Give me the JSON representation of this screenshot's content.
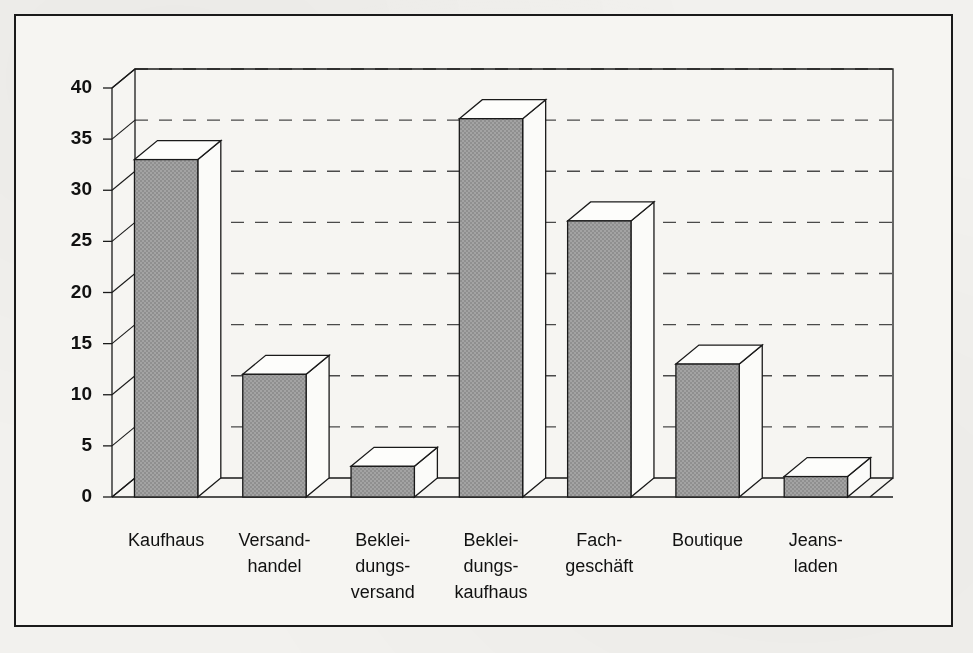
{
  "chart_data": {
    "type": "bar",
    "title": "",
    "subtitle": "",
    "xlabel": "",
    "ylabel": "",
    "ylim": [
      0,
      40
    ],
    "yticks": [
      0,
      5,
      10,
      15,
      20,
      25,
      30,
      35,
      40
    ],
    "grid": true,
    "grid_style": "dashed-horizontal",
    "legend": "none",
    "style": "3d-isometric-bars",
    "categories": [
      "Kaufhaus",
      "Versand-\nhandel",
      "Beklei-\ndungs-\nversand",
      "Beklei-\ndungs-\nkaufhaus",
      "Fach-\ngeschäft",
      "Boutique",
      "Jeans-\nladen"
    ],
    "category_lines": [
      [
        "Kaufhaus"
      ],
      [
        "Versand-",
        "handel"
      ],
      [
        "Beklei-",
        "dungs-",
        "versand"
      ],
      [
        "Beklei-",
        "dungs-",
        "kaufhaus"
      ],
      [
        "Fach-",
        "geschäft"
      ],
      [
        "Boutique"
      ],
      [
        "Jeans-",
        "laden"
      ]
    ],
    "values": [
      33,
      12,
      3,
      37,
      27,
      13,
      2
    ],
    "colors": {
      "bar_front": "#9e9e9e",
      "bar_top": "#fdfdfb",
      "bar_side": "#fbfbf9",
      "outline": "#1a1a1a",
      "grid": "#4a4a4a",
      "frame": "#1a1a1a",
      "background": "#f6f5f2",
      "page": "#f2f1ee"
    }
  }
}
